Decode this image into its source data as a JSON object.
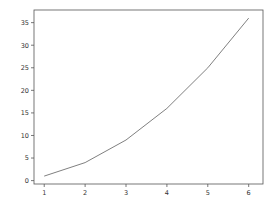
{
  "chart_data": {
    "type": "line",
    "title": "",
    "xlabel": "",
    "ylabel": "",
    "x": [
      1,
      2,
      3,
      4,
      5,
      6
    ],
    "series": [
      {
        "name": "",
        "values": [
          1,
          4,
          9,
          16,
          25,
          36
        ],
        "color": "#808080"
      }
    ],
    "xticks": [
      "1",
      "2",
      "3",
      "4",
      "5",
      "6"
    ],
    "yticks": [
      "0",
      "5",
      "10",
      "15",
      "20",
      "25",
      "30",
      "35"
    ],
    "xlim": [
      0.75,
      6.35
    ],
    "ylim": [
      -0.75,
      37.8
    ],
    "grid": false,
    "legend": null
  },
  "colors": {
    "axis": "#555555",
    "line": "#808080",
    "background": "#ffffff"
  }
}
